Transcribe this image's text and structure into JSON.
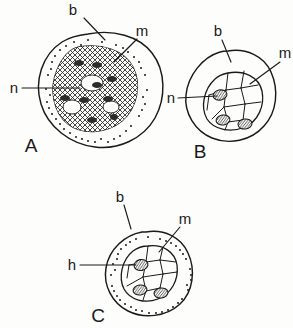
{
  "figure": {
    "background_color": "#fdfdfc",
    "ink_color": "#1a1a1a",
    "style": "hand-drawn line illustration"
  },
  "legend_keys": {
    "b": "b",
    "m": "m",
    "n": "n",
    "h": "h"
  },
  "panels": [
    {
      "id": "A",
      "panel_label": "A",
      "position": "top-left",
      "outer_texture": "stippled",
      "inner_texture": "cross-hatched",
      "inclusion_count": 0,
      "dark_patch_count": 8,
      "white_gap_count": 3,
      "labels": [
        {
          "key": "b",
          "text": "b",
          "target": "outer-boundary"
        },
        {
          "key": "m",
          "text": "m",
          "target": "inner-mass"
        },
        {
          "key": "n",
          "text": "n",
          "target": "nucleus-region"
        }
      ]
    },
    {
      "id": "B",
      "panel_label": "B",
      "position": "top-right",
      "outer_texture": "plain",
      "inner_texture": "polygonal-cells",
      "inclusion_count": 3,
      "dark_patch_count": 0,
      "white_gap_count": 0,
      "labels": [
        {
          "key": "b",
          "text": "b",
          "target": "outer-boundary"
        },
        {
          "key": "m",
          "text": "m",
          "target": "inner-mass"
        },
        {
          "key": "n",
          "text": "n",
          "target": "nucleus-region"
        }
      ]
    },
    {
      "id": "C",
      "panel_label": "C",
      "position": "bottom-center",
      "outer_texture": "stippled",
      "inner_texture": "polygonal-cells",
      "inclusion_count": 3,
      "dark_patch_count": 0,
      "white_gap_count": 0,
      "labels": [
        {
          "key": "b",
          "text": "b",
          "target": "outer-boundary"
        },
        {
          "key": "m",
          "text": "m",
          "target": "inner-mass"
        },
        {
          "key": "h",
          "text": "h",
          "target": "nucleus-region"
        }
      ]
    }
  ]
}
